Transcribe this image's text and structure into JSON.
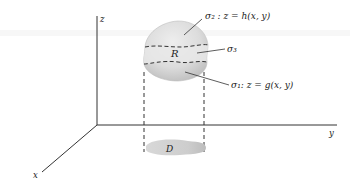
{
  "figure": {
    "axes": {
      "z_label": "z",
      "y_label": "y",
      "x_label": "x"
    },
    "region": {
      "label": "R"
    },
    "surfaces": {
      "sigma2": {
        "label": "σ₂ : z = h(x, y)"
      },
      "sigma3": {
        "label": "σ₃"
      },
      "sigma1": {
        "label": "σ₁:  z = g(x, y)"
      }
    },
    "domain": {
      "label": "D"
    },
    "colors": {
      "axis": "#333333",
      "solid_fill": "#d9d9d9",
      "band_fill": "#e6e6e6",
      "shadow_fill": "#cfcfcf"
    }
  }
}
